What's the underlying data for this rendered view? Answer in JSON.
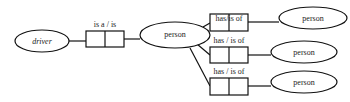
{
  "diagram": {
    "type": "entity-relationship",
    "nodes": [
      {
        "id": "driver",
        "label": "driver",
        "shape": "ellipse"
      },
      {
        "id": "person_center",
        "label": "person",
        "shape": "ellipse"
      },
      {
        "id": "person_top",
        "label": "person",
        "shape": "ellipse"
      },
      {
        "id": "person_mid",
        "label": "person",
        "shape": "ellipse"
      },
      {
        "id": "person_bot",
        "label": "person",
        "shape": "ellipse"
      }
    ],
    "relations": [
      {
        "id": "rel_isa",
        "label": "is a / is",
        "from": "driver",
        "to": "person_center"
      },
      {
        "id": "rel_top",
        "label": "has/is of",
        "from": "person_center",
        "to": "person_top"
      },
      {
        "id": "rel_mid",
        "label": "has / is of",
        "from": "person_center",
        "to": "person_mid"
      },
      {
        "id": "rel_bot",
        "label": "has / is of",
        "from": "person_center",
        "to": "person_bot"
      }
    ]
  },
  "labels": {
    "driver": "driver",
    "person_center": "person",
    "person_top": "person",
    "person_mid": "person",
    "person_bot": "person",
    "rel_isa": "is a / is",
    "rel_top": "has/is of",
    "rel_mid": "has / is of",
    "rel_bot": "has / is of"
  },
  "colors": {
    "stroke": "#111111",
    "background": "#ffffff",
    "text": "#222222"
  }
}
